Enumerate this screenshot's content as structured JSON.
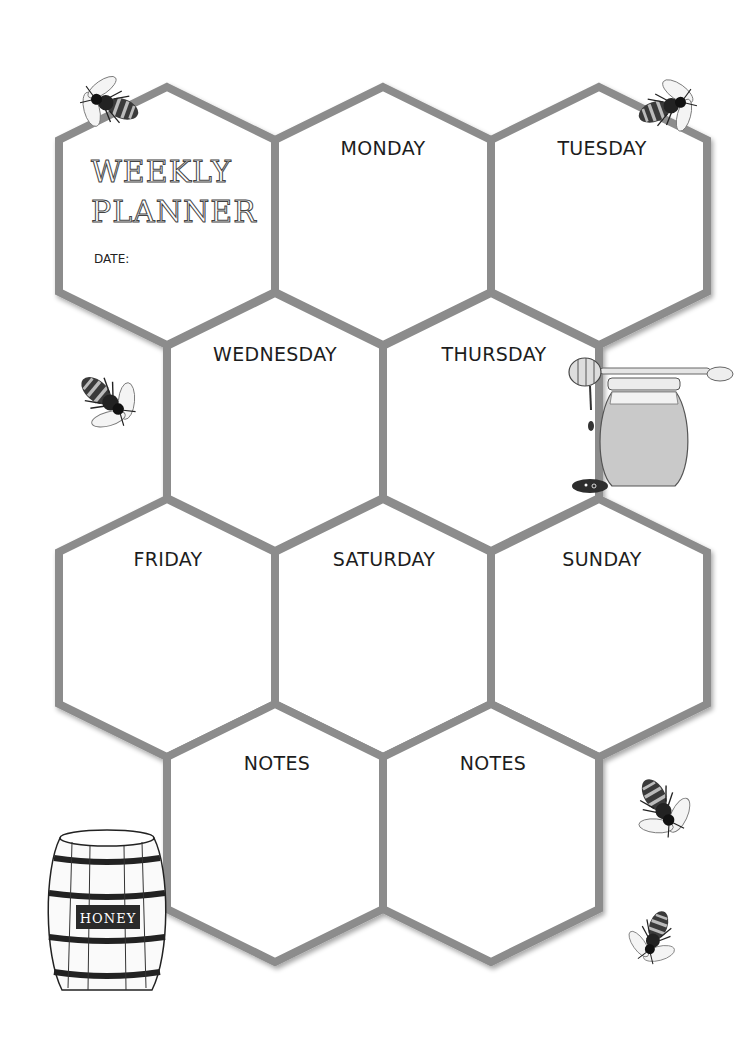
{
  "planner": {
    "title_line1": "WEEKLY",
    "title_line2": "PLANNER",
    "date_label": "DATE:",
    "date_value": "",
    "border_color": "#8c8c8c",
    "days": [
      {
        "label": "MONDAY"
      },
      {
        "label": "TUESDAY"
      },
      {
        "label": "WEDNESDAY"
      },
      {
        "label": "THURSDAY"
      },
      {
        "label": "FRIDAY"
      },
      {
        "label": "SATURDAY"
      },
      {
        "label": "SUNDAY"
      }
    ],
    "notes": [
      {
        "label": "NOTES"
      },
      {
        "label": "NOTES"
      }
    ]
  },
  "decorations": {
    "barrel_label": "HONEY",
    "icons": [
      "bee-icon",
      "bee-icon",
      "bee-icon",
      "honey-jar-icon",
      "honey-dipper-icon",
      "honey-barrel-icon",
      "bee-icon",
      "bee-icon"
    ]
  }
}
